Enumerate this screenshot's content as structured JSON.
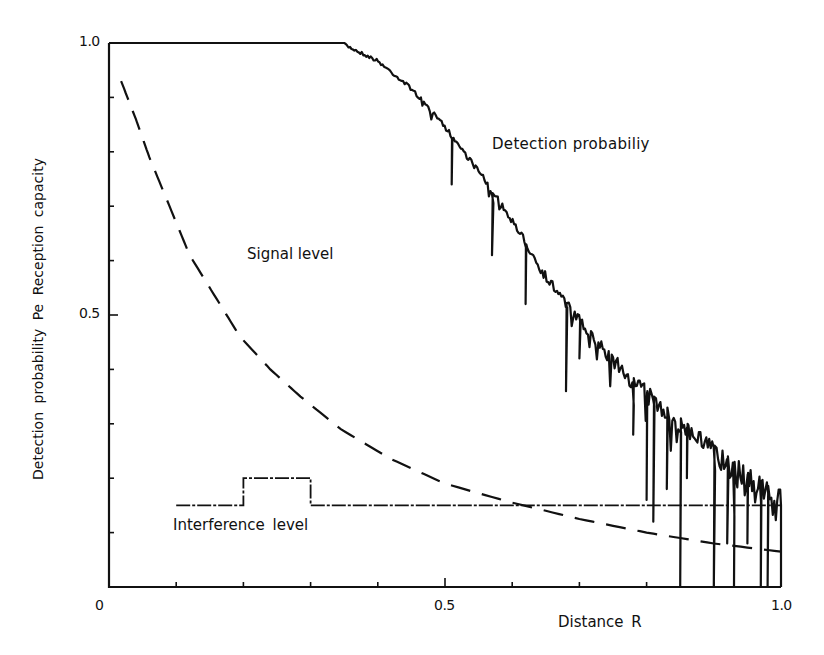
{
  "chart_data": {
    "type": "line",
    "title": "",
    "xlabel": "Distance  R",
    "ylabel": "Detection  probability  Pe  Reception  capacity",
    "xlim": [
      0,
      1.0
    ],
    "ylim": [
      0,
      1.0
    ],
    "grid": false,
    "legend": "none (inline annotations)",
    "x_ticks": [
      0,
      0.1,
      0.2,
      0.3,
      0.4,
      0.5,
      0.6,
      0.7,
      0.8,
      0.9,
      1.0
    ],
    "x_tick_labels": [
      {
        "value": 0,
        "label": "0"
      },
      {
        "value": 0.5,
        "label": "0.5"
      },
      {
        "value": 1.0,
        "label": "1.0"
      }
    ],
    "y_ticks": [
      0,
      0.1,
      0.2,
      0.3,
      0.4,
      0.5,
      0.6,
      0.7,
      0.8,
      0.9,
      1.0
    ],
    "y_tick_labels": [
      {
        "value": 0.5,
        "label": "0.5"
      },
      {
        "value": 1.0,
        "label": "1.0"
      }
    ],
    "annotations": [
      {
        "text": "Detection probabiliy",
        "x": 0.57,
        "y": 0.83
      },
      {
        "text": "Signal level",
        "x": 0.21,
        "y": 0.61
      },
      {
        "text": "Interference  level",
        "x": 0.1,
        "y": 0.115
      }
    ],
    "series": [
      {
        "name": "Detection probability",
        "style": "solid-noisy",
        "envelope": {
          "x": [
            0.0,
            0.35,
            0.4,
            0.45,
            0.5,
            0.55,
            0.6,
            0.65,
            0.7,
            0.75,
            0.8,
            0.85,
            0.9,
            0.95,
            1.0
          ],
          "y": [
            1.0,
            1.0,
            0.97,
            0.92,
            0.85,
            0.77,
            0.68,
            0.58,
            0.5,
            0.43,
            0.37,
            0.32,
            0.27,
            0.22,
            0.18
          ]
        },
        "deep_dips": [
          {
            "x": 0.51,
            "y": 0.74
          },
          {
            "x": 0.57,
            "y": 0.61
          },
          {
            "x": 0.62,
            "y": 0.52
          },
          {
            "x": 0.68,
            "y": 0.36
          },
          {
            "x": 0.7,
            "y": 0.42
          },
          {
            "x": 0.78,
            "y": 0.28
          },
          {
            "x": 0.8,
            "y": 0.16
          },
          {
            "x": 0.81,
            "y": 0.12
          },
          {
            "x": 0.83,
            "y": 0.18
          },
          {
            "x": 0.85,
            "y": 0.0
          },
          {
            "x": 0.86,
            "y": 0.2
          },
          {
            "x": 0.9,
            "y": 0.0
          },
          {
            "x": 0.92,
            "y": 0.08
          },
          {
            "x": 0.93,
            "y": 0.0
          },
          {
            "x": 0.95,
            "y": 0.08
          },
          {
            "x": 0.97,
            "y": 0.0
          },
          {
            "x": 0.98,
            "y": 0.0
          },
          {
            "x": 1.0,
            "y": 0.0
          }
        ]
      },
      {
        "name": "Signal level",
        "style": "dashed",
        "x": [
          0.018,
          0.04,
          0.06,
          0.09,
          0.12,
          0.16,
          0.195,
          0.24,
          0.285,
          0.345,
          0.42,
          0.5,
          0.6,
          0.7,
          0.8,
          0.9,
          1.0
        ],
        "y": [
          0.93,
          0.86,
          0.79,
          0.7,
          0.61,
          0.53,
          0.46,
          0.4,
          0.35,
          0.29,
          0.235,
          0.19,
          0.155,
          0.125,
          0.1,
          0.08,
          0.065
        ]
      },
      {
        "name": "Interference level",
        "style": "dash-dot step",
        "x": [
          0.1,
          0.2,
          0.2,
          0.3,
          0.3,
          1.0
        ],
        "y": [
          0.15,
          0.15,
          0.2,
          0.2,
          0.15,
          0.15
        ]
      }
    ]
  },
  "labels": {
    "y_axis": "Detection  probability  Pe  Reception  capacity",
    "x_axis": "Distance  R",
    "detection": "Detection probabiliy",
    "signal": "Signal level",
    "interference": "Interference  level",
    "x0": "0",
    "x05": "0.5",
    "x10": "1.0",
    "y05": "0.5",
    "y10": "1.0"
  }
}
